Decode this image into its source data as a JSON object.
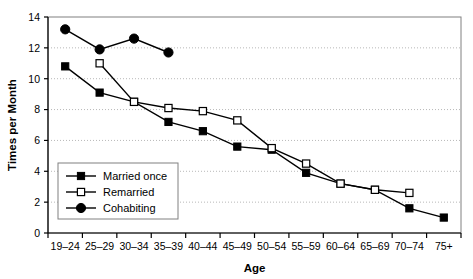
{
  "chart_data": {
    "type": "line",
    "title": "",
    "xlabel": "Age",
    "ylabel": "Times per Month",
    "categories": [
      "19–24",
      "25–29",
      "30–34",
      "35–39",
      "40–44",
      "45–49",
      "50–54",
      "55–59",
      "60–64",
      "65–69",
      "70–74",
      "75+"
    ],
    "series": [
      {
        "name": "Married once",
        "marker": "filled-square",
        "color": "#000000",
        "values": [
          10.8,
          9.1,
          8.5,
          7.2,
          6.6,
          5.6,
          5.4,
          3.9,
          3.2,
          2.8,
          1.6,
          1.0
        ]
      },
      {
        "name": "Remarried",
        "marker": "open-square",
        "color": "#000000",
        "values": [
          null,
          11.0,
          8.5,
          8.1,
          7.9,
          7.3,
          5.5,
          4.5,
          3.2,
          2.8,
          2.6,
          null
        ]
      },
      {
        "name": "Cohabiting",
        "marker": "filled-circle",
        "color": "#000000",
        "values": [
          13.2,
          11.9,
          12.6,
          11.7,
          null,
          null,
          null,
          null,
          null,
          null,
          null,
          null
        ]
      }
    ],
    "ylim": [
      0,
      14
    ],
    "yticks": [
      0,
      2,
      4,
      6,
      8,
      10,
      12,
      14
    ],
    "ytick_labels": [
      "0",
      "2",
      "4",
      "6",
      "8",
      "10",
      "12",
      "14"
    ],
    "grid": "horizontal-dotted",
    "grid_color": "#b8b8b8",
    "legend_position": "bottom-left",
    "frame_color": "#808080",
    "axis_color": "#000000"
  }
}
